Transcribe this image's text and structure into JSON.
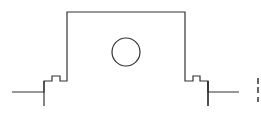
{
  "diagram": {
    "type": "line-art cross-section",
    "stroke_color": "#333333",
    "background": "#ffffff",
    "body": {
      "outline_points": [
        [
          12,
          92
        ],
        [
          44,
          92
        ],
        [
          44,
          81
        ],
        [
          52,
          81
        ],
        [
          52,
          76
        ],
        [
          60,
          76
        ],
        [
          60,
          81
        ],
        [
          67,
          81
        ],
        [
          67,
          12
        ],
        [
          185,
          12
        ],
        [
          185,
          81
        ],
        [
          193,
          81
        ],
        [
          193,
          76
        ],
        [
          200,
          76
        ],
        [
          200,
          81
        ],
        [
          208,
          81
        ],
        [
          208,
          92
        ],
        [
          239,
          92
        ]
      ],
      "left_stem": {
        "x": 44,
        "y1": 81,
        "y2": 106
      },
      "right_stem": {
        "x": 208,
        "y1": 81,
        "y2": 106
      }
    },
    "hole": {
      "cx": 126,
      "cy": 52,
      "r": 14
    },
    "edge_dashes": [
      {
        "x": 258,
        "y1": 78,
        "y2": 84
      },
      {
        "x": 258,
        "y1": 87,
        "y2": 93
      },
      {
        "x": 258,
        "y1": 97,
        "y2": 102
      }
    ]
  }
}
